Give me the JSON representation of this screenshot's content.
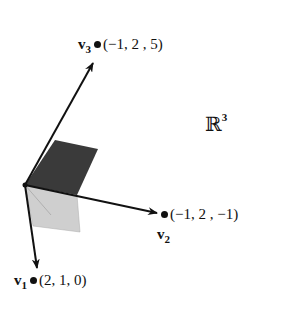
{
  "space": {
    "symbol": "ℝ",
    "exponent": "3"
  },
  "vectors": [
    {
      "name": "v",
      "index": "1",
      "coords": "(2, 1, 0)"
    },
    {
      "name": "v",
      "index": "2",
      "coords": "(−1, 2 , −1)"
    },
    {
      "name": "v",
      "index": "3",
      "coords": "(−1, 2 , 5)"
    }
  ],
  "colors": {
    "ink": "#111111",
    "dark_plane": "#3a3a3a",
    "light_plane": "#c8c8c8"
  }
}
